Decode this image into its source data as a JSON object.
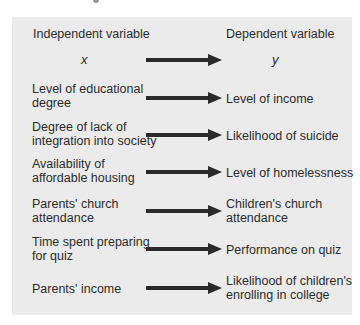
{
  "diagram": {
    "headers": {
      "independent": "Independent variable",
      "dependent": "Dependent variable"
    },
    "symbols": {
      "x": "x",
      "y": "y"
    },
    "colors": {
      "panel_background": "#ebebeb",
      "text": "#2b2b2b",
      "arrow": "#2a2a2a"
    },
    "rows": [
      {
        "independent_line1": "Level of educational",
        "independent_line2": "degree",
        "dependent_line1": "Level of income",
        "dependent_line2": ""
      },
      {
        "independent_line1": "Degree of lack of",
        "independent_line2": "integration into society",
        "dependent_line1": "Likelihood of suicide",
        "dependent_line2": ""
      },
      {
        "independent_line1": "Availability of",
        "independent_line2": "affordable housing",
        "dependent_line1": "Level of homelessness",
        "dependent_line2": ""
      },
      {
        "independent_line1": "Parents' church",
        "independent_line2": "attendance",
        "dependent_line1": "Children's church",
        "dependent_line2": "attendance"
      },
      {
        "independent_line1": "Time spent preparing",
        "independent_line2": "for quiz",
        "dependent_line1": "Performance on quiz",
        "dependent_line2": ""
      },
      {
        "independent_line1": "Parents' income",
        "independent_line2": "",
        "dependent_line1": "Likelihood of children's",
        "dependent_line2": "enrolling in college"
      }
    ]
  }
}
